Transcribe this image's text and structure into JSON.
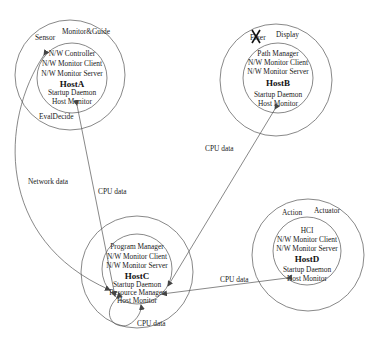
{
  "hosts": {
    "A": {
      "name": "HostA",
      "outer_labels": [
        "Sensor",
        "Monitor&Guide",
        "EvalDecide"
      ],
      "processes_top": [
        "N/W Controller",
        "N/W Monitor Client",
        "N/W Monitor Server"
      ],
      "processes_bottom": [
        "Startup Daemon",
        "Host Monitor"
      ]
    },
    "B": {
      "name": "HostB",
      "outer_labels": [
        "Fixer",
        "Display"
      ],
      "struck_label": "Fixer",
      "processes_top": [
        "Path Manager",
        "N/W Monitor Client",
        "N/W Monitor Server"
      ],
      "processes_bottom": [
        "Startup Daemon",
        "Host Monitor"
      ]
    },
    "C": {
      "name": "HostC",
      "outer_labels": [],
      "processes_top": [
        "Program Manager",
        "N/W Monitor Client",
        "N/W Monitor Server"
      ],
      "processes_bottom": [
        "Startup Daemon",
        "Resource Manager",
        "Host Monitor"
      ]
    },
    "D": {
      "name": "HostD",
      "outer_labels": [
        "Action",
        "Actuator"
      ],
      "processes_top": [
        "HCI",
        "N/W Monitor Client",
        "N/W Monitor Server"
      ],
      "processes_bottom": [
        "Startup Daemon",
        "Host Monitor"
      ]
    }
  },
  "edges": [
    {
      "from": "HostA N/W Controller",
      "to": "HostC Resource Manager",
      "label": "Network data"
    },
    {
      "from": "HostA Host Monitor",
      "to": "HostC Resource Manager",
      "label": "CPU data"
    },
    {
      "from": "HostB Host Monitor",
      "to": "HostC Resource Manager",
      "label": "CPU data"
    },
    {
      "from": "HostD Host Monitor",
      "to": "HostC Resource Manager",
      "label": "CPU data"
    },
    {
      "from": "HostC Host Monitor",
      "to": "HostC Resource Manager",
      "label": "CPU data"
    }
  ]
}
